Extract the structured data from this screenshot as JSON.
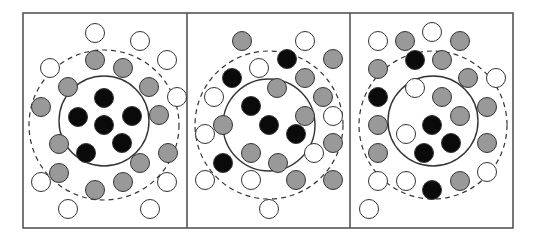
{
  "diagram": {
    "type": "particle-clusters",
    "panel_count": 3,
    "frame": {
      "x": 23,
      "y": 13,
      "width": 490,
      "height": 215
    },
    "dividers_x": [
      187,
      350
    ],
    "colors": {
      "black": "#0a0a0a",
      "gray": "#999999",
      "white": "#ffffff",
      "stroke": "#333333",
      "frame": "#555555"
    },
    "particle_radius": 9.5,
    "panels": [
      {
        "name": "panel-1",
        "inner_circle": {
          "cx": 104,
          "cy": 121,
          "r": 45
        },
        "dashed_circle": {
          "cx": 104,
          "cy": 125,
          "r": 75
        },
        "particles": [
          {
            "x": 104,
            "y": 98,
            "c": "black"
          },
          {
            "x": 78,
            "y": 117,
            "c": "black"
          },
          {
            "x": 132,
            "y": 116,
            "c": "black"
          },
          {
            "x": 104,
            "y": 125,
            "c": "black"
          },
          {
            "x": 122,
            "y": 143,
            "c": "black"
          },
          {
            "x": 86,
            "y": 153,
            "c": "black"
          },
          {
            "x": 95,
            "y": 60,
            "c": "gray"
          },
          {
            "x": 123,
            "y": 68,
            "c": "gray"
          },
          {
            "x": 68,
            "y": 87,
            "c": "gray"
          },
          {
            "x": 149,
            "y": 87,
            "c": "gray"
          },
          {
            "x": 41,
            "y": 107,
            "c": "gray"
          },
          {
            "x": 159,
            "y": 115,
            "c": "gray"
          },
          {
            "x": 59,
            "y": 144,
            "c": "gray"
          },
          {
            "x": 168,
            "y": 153,
            "c": "gray"
          },
          {
            "x": 140,
            "y": 163,
            "c": "gray"
          },
          {
            "x": 59,
            "y": 173,
            "c": "gray"
          },
          {
            "x": 123,
            "y": 182,
            "c": "gray"
          },
          {
            "x": 95,
            "y": 190,
            "c": "gray"
          },
          {
            "x": 95,
            "y": 33,
            "c": "white"
          },
          {
            "x": 140,
            "y": 41,
            "c": "white"
          },
          {
            "x": 50,
            "y": 68,
            "c": "white"
          },
          {
            "x": 167,
            "y": 60,
            "c": "white"
          },
          {
            "x": 177,
            "y": 97,
            "c": "white"
          },
          {
            "x": 41,
            "y": 182,
            "c": "white"
          },
          {
            "x": 167,
            "y": 182,
            "c": "white"
          },
          {
            "x": 68,
            "y": 209,
            "c": "white"
          },
          {
            "x": 150,
            "y": 209,
            "c": "white"
          }
        ]
      },
      {
        "name": "panel-2",
        "inner_circle": {
          "cx": 269,
          "cy": 125,
          "r": 46
        },
        "dashed_circle": {
          "cx": 269,
          "cy": 125,
          "r": 74
        },
        "particles": [
          {
            "x": 242,
            "y": 41,
            "c": "gray"
          },
          {
            "x": 305,
            "y": 41,
            "c": "white"
          },
          {
            "x": 287,
            "y": 59,
            "c": "black"
          },
          {
            "x": 333,
            "y": 59,
            "c": "gray"
          },
          {
            "x": 259,
            "y": 68,
            "c": "white"
          },
          {
            "x": 232,
            "y": 78,
            "c": "black"
          },
          {
            "x": 305,
            "y": 78,
            "c": "gray"
          },
          {
            "x": 277,
            "y": 88,
            "c": "gray"
          },
          {
            "x": 214,
            "y": 97,
            "c": "white"
          },
          {
            "x": 323,
            "y": 97,
            "c": "gray"
          },
          {
            "x": 251,
            "y": 106,
            "c": "black"
          },
          {
            "x": 305,
            "y": 116,
            "c": "gray"
          },
          {
            "x": 333,
            "y": 116,
            "c": "white"
          },
          {
            "x": 223,
            "y": 125,
            "c": "gray"
          },
          {
            "x": 269,
            "y": 125,
            "c": "black"
          },
          {
            "x": 205,
            "y": 134,
            "c": "white"
          },
          {
            "x": 296,
            "y": 134,
            "c": "black"
          },
          {
            "x": 333,
            "y": 143,
            "c": "gray"
          },
          {
            "x": 251,
            "y": 153,
            "c": "gray"
          },
          {
            "x": 314,
            "y": 153,
            "c": "white"
          },
          {
            "x": 223,
            "y": 163,
            "c": "black"
          },
          {
            "x": 278,
            "y": 163,
            "c": "gray"
          },
          {
            "x": 205,
            "y": 180,
            "c": "white"
          },
          {
            "x": 251,
            "y": 180,
            "c": "white"
          },
          {
            "x": 296,
            "y": 180,
            "c": "gray"
          },
          {
            "x": 333,
            "y": 180,
            "c": "gray"
          },
          {
            "x": 269,
            "y": 209,
            "c": "white"
          }
        ]
      },
      {
        "name": "panel-3",
        "inner_circle": {
          "cx": 433,
          "cy": 121,
          "r": 45
        },
        "dashed_circle": {
          "cx": 433,
          "cy": 125,
          "r": 74
        },
        "particles": [
          {
            "x": 432,
            "y": 32,
            "c": "white"
          },
          {
            "x": 378,
            "y": 41,
            "c": "white"
          },
          {
            "x": 405,
            "y": 41,
            "c": "gray"
          },
          {
            "x": 460,
            "y": 41,
            "c": "gray"
          },
          {
            "x": 415,
            "y": 60,
            "c": "black"
          },
          {
            "x": 442,
            "y": 60,
            "c": "gray"
          },
          {
            "x": 378,
            "y": 69,
            "c": "gray"
          },
          {
            "x": 468,
            "y": 78,
            "c": "gray"
          },
          {
            "x": 496,
            "y": 78,
            "c": "white"
          },
          {
            "x": 415,
            "y": 88,
            "c": "white"
          },
          {
            "x": 378,
            "y": 97,
            "c": "black"
          },
          {
            "x": 442,
            "y": 97,
            "c": "gray"
          },
          {
            "x": 487,
            "y": 107,
            "c": "gray"
          },
          {
            "x": 460,
            "y": 116,
            "c": "gray"
          },
          {
            "x": 378,
            "y": 125,
            "c": "gray"
          },
          {
            "x": 432,
            "y": 125,
            "c": "black"
          },
          {
            "x": 406,
            "y": 134,
            "c": "white"
          },
          {
            "x": 451,
            "y": 143,
            "c": "black"
          },
          {
            "x": 487,
            "y": 143,
            "c": "gray"
          },
          {
            "x": 378,
            "y": 153,
            "c": "gray"
          },
          {
            "x": 424,
            "y": 153,
            "c": "black"
          },
          {
            "x": 487,
            "y": 172,
            "c": "white"
          },
          {
            "x": 378,
            "y": 181,
            "c": "white"
          },
          {
            "x": 406,
            "y": 181,
            "c": "white"
          },
          {
            "x": 460,
            "y": 181,
            "c": "gray"
          },
          {
            "x": 432,
            "y": 190,
            "c": "black"
          },
          {
            "x": 369,
            "y": 209,
            "c": "white"
          }
        ]
      }
    ]
  }
}
